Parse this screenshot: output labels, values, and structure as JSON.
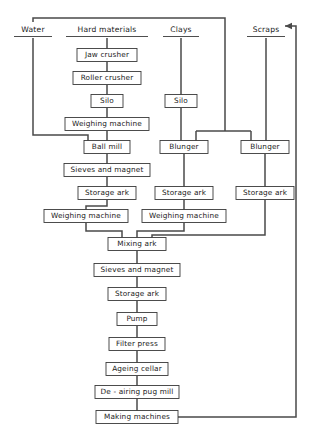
{
  "diagram": {
    "type": "process-flowchart",
    "width": 314,
    "height": 440,
    "line_color": "#4a4a4a",
    "box_stroke": "#3a3a3a",
    "box_fill": "#ffffff",
    "text_color": "#1a1a1a",
    "background": "#ffffff",
    "headings": [
      {
        "id": "water",
        "label": "Water",
        "x": 33,
        "y": 30
      },
      {
        "id": "hard_materials",
        "label": "Hard materials",
        "x": 107,
        "y": 30
      },
      {
        "id": "clays",
        "label": "Clays",
        "x": 181,
        "y": 30
      },
      {
        "id": "scraps",
        "label": "Scraps",
        "x": 266,
        "y": 30
      }
    ],
    "nodes": [
      {
        "id": "jaw_crusher",
        "label": "Jaw crusher",
        "cx": 107,
        "cy": 55,
        "w": 60,
        "h": 13
      },
      {
        "id": "roller_crusher",
        "label": "Roller crusher",
        "cx": 107,
        "cy": 78,
        "w": 68,
        "h": 13
      },
      {
        "id": "silo_hard",
        "label": "Silo",
        "cx": 107,
        "cy": 101,
        "w": 32,
        "h": 13
      },
      {
        "id": "weighing_machine_hard",
        "label": "Weighing machine",
        "cx": 107,
        "cy": 124,
        "w": 84,
        "h": 13
      },
      {
        "id": "ball_mill",
        "label": "Ball mill",
        "cx": 107,
        "cy": 147,
        "w": 46,
        "h": 13
      },
      {
        "id": "sieves_and_magnet_ball",
        "label": "Sieves and magnet",
        "cx": 107,
        "cy": 170,
        "w": 86,
        "h": 13
      },
      {
        "id": "storage_ark_ball",
        "label": "Storage ark",
        "cx": 107,
        "cy": 193,
        "w": 58,
        "h": 13
      },
      {
        "id": "weighing_machine_left",
        "label": "Weighing machine",
        "cx": 86,
        "cy": 216,
        "w": 84,
        "h": 13
      },
      {
        "id": "silo_clays",
        "label": "Silo",
        "cx": 181,
        "cy": 101,
        "w": 32,
        "h": 13
      },
      {
        "id": "blunger_left",
        "label": "Blunger",
        "cx": 184,
        "cy": 147,
        "w": 48,
        "h": 13
      },
      {
        "id": "storage_ark_clays",
        "label": "Storage ark",
        "cx": 184,
        "cy": 193,
        "w": 58,
        "h": 13
      },
      {
        "id": "weighing_machine_mid",
        "label": "Weighing machine",
        "cx": 184,
        "cy": 216,
        "w": 84,
        "h": 13
      },
      {
        "id": "blunger_right",
        "label": "Blunger",
        "cx": 265,
        "cy": 147,
        "w": 48,
        "h": 13
      },
      {
        "id": "storage_ark_scraps",
        "label": "Storage ark",
        "cx": 265,
        "cy": 193,
        "w": 58,
        "h": 13
      },
      {
        "id": "mixing_ark",
        "label": "Mixing ark",
        "cx": 137,
        "cy": 244,
        "w": 58,
        "h": 13
      },
      {
        "id": "sieves_and_magnet_mix",
        "label": "Sieves and magnet",
        "cx": 137,
        "cy": 270,
        "w": 86,
        "h": 13
      },
      {
        "id": "storage_ark_mix",
        "label": "Storage ark",
        "cx": 137,
        "cy": 294,
        "w": 58,
        "h": 13
      },
      {
        "id": "pump",
        "label": "Pump",
        "cx": 137,
        "cy": 319,
        "w": 40,
        "h": 13
      },
      {
        "id": "filter_press",
        "label": "Filter press",
        "cx": 137,
        "cy": 344,
        "w": 56,
        "h": 13
      },
      {
        "id": "ageing_cellar",
        "label": "Ageing cellar",
        "cx": 137,
        "cy": 369,
        "w": 62,
        "h": 13
      },
      {
        "id": "de_airing_pug_mill",
        "label": "De - airing pug mill",
        "cx": 137,
        "cy": 392,
        "w": 84,
        "h": 13
      },
      {
        "id": "making_machines",
        "label": "Making machines",
        "cx": 137,
        "cy": 417,
        "w": 82,
        "h": 13
      }
    ],
    "edges": [
      {
        "id": "water-to-header",
        "from": "water",
        "to": "top-rail"
      },
      {
        "id": "water-to-ball-mill",
        "from": "water",
        "to": "ball_mill"
      },
      {
        "id": "water-to-blungers",
        "from": "top-rail",
        "to": "blunger_left,blunger_right"
      },
      {
        "id": "hard-materials-to-jaw",
        "from": "hard_materials",
        "to": "jaw_crusher"
      },
      {
        "id": "jaw-to-roller",
        "from": "jaw_crusher",
        "to": "roller_crusher"
      },
      {
        "id": "roller-to-silo",
        "from": "roller_crusher",
        "to": "silo_hard"
      },
      {
        "id": "silo-to-weighing",
        "from": "silo_hard",
        "to": "weighing_machine_hard"
      },
      {
        "id": "weighing-to-ball-mill",
        "from": "weighing_machine_hard",
        "to": "ball_mill"
      },
      {
        "id": "ball-mill-to-sieves",
        "from": "ball_mill",
        "to": "sieves_and_magnet_ball"
      },
      {
        "id": "sieves-to-storage",
        "from": "sieves_and_magnet_ball",
        "to": "storage_ark_ball"
      },
      {
        "id": "storage-to-weighing-left",
        "from": "storage_ark_ball",
        "to": "weighing_machine_left"
      },
      {
        "id": "clays-to-silo",
        "from": "clays",
        "to": "silo_clays"
      },
      {
        "id": "silo-clays-to-blunger",
        "from": "silo_clays",
        "to": "blunger_left"
      },
      {
        "id": "blunger-left-to-storage",
        "from": "blunger_left",
        "to": "storage_ark_clays"
      },
      {
        "id": "storage-clays-to-weighing",
        "from": "storage_ark_clays",
        "to": "weighing_machine_mid"
      },
      {
        "id": "scraps-to-blunger-right",
        "from": "scraps",
        "to": "blunger_right"
      },
      {
        "id": "blunger-right-to-storage",
        "from": "blunger_right",
        "to": "storage_ark_scraps"
      },
      {
        "id": "storage-scraps-to-mixing",
        "from": "storage_ark_scraps",
        "to": "mixing_ark"
      },
      {
        "id": "weighing-left-to-mixing",
        "from": "weighing_machine_left",
        "to": "mixing_ark"
      },
      {
        "id": "weighing-mid-to-mixing",
        "from": "weighing_machine_mid",
        "to": "mixing_ark"
      },
      {
        "id": "mixing-to-sieves",
        "from": "mixing_ark",
        "to": "sieves_and_magnet_mix"
      },
      {
        "id": "sieves-to-storage-mix",
        "from": "sieves_and_magnet_mix",
        "to": "storage_ark_mix"
      },
      {
        "id": "storage-mix-to-pump",
        "from": "storage_ark_mix",
        "to": "pump"
      },
      {
        "id": "pump-to-filter-press",
        "from": "pump",
        "to": "filter_press"
      },
      {
        "id": "filter-press-to-ageing",
        "from": "filter_press",
        "to": "ageing_cellar"
      },
      {
        "id": "ageing-to-pug-mill",
        "from": "ageing_cellar",
        "to": "de_airing_pug_mill"
      },
      {
        "id": "pug-mill-to-making",
        "from": "de_airing_pug_mill",
        "to": "making_machines"
      },
      {
        "id": "making-machines-to-scraps",
        "from": "making_machines",
        "to": "scraps",
        "arrow": true
      }
    ]
  }
}
